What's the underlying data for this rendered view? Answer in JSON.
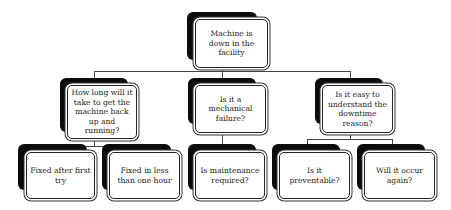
{
  "diagram": {
    "type": "tree",
    "root": {
      "label": "Machine is down in the facility"
    },
    "level1": [
      {
        "label": "How long will it take to get the machine back up and running?"
      },
      {
        "label": "Is it a mechanical failure?"
      },
      {
        "label": "Is it easy to understand the downtime reason?"
      }
    ],
    "level2": [
      {
        "label": "Fixed after first try",
        "parent": 0
      },
      {
        "label": "Fixed in less than one hour",
        "parent": 0
      },
      {
        "label": "Is maintenance required?",
        "parent": 1
      },
      {
        "label": "Is it preventable?",
        "parent": 2
      },
      {
        "label": "Will it occur again?",
        "parent": 2
      }
    ]
  }
}
